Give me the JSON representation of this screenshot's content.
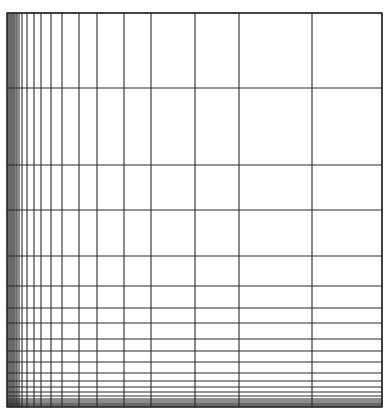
{
  "diagram": {
    "type": "logarithmic-grid",
    "frame": {
      "left": 7,
      "top": 13,
      "right": 382,
      "bottom": 407
    },
    "line_color": "#2a2a2a",
    "shade_color": "#8a8a8a",
    "vertical_lines_x": [
      7,
      8,
      9,
      10,
      11,
      12,
      13,
      14,
      15,
      16,
      17,
      19,
      22,
      27,
      34,
      41,
      51,
      62,
      79,
      97,
      124,
      151,
      195,
      239,
      312,
      382
    ],
    "horizontal_lines_y": [
      13,
      88,
      165,
      210,
      256,
      286,
      308,
      323,
      339,
      351,
      362,
      373,
      381,
      387,
      392,
      396,
      399,
      401,
      403,
      404,
      405,
      406,
      407
    ]
  }
}
